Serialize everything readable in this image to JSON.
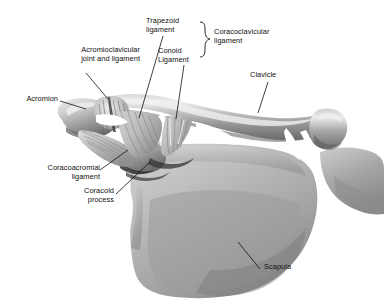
{
  "figure": {
    "background_color": "#ffffff",
    "ink_color": "#101010",
    "width": 384,
    "height": 300,
    "style": "grayscale airbrushed medical illustration"
  },
  "labels": {
    "acromioclavicular": "Acromioclavicular\njoint and ligament",
    "acromion": "Acromion",
    "trapezoid": "Trapezoid\nligament",
    "conoid": "Conoid\nLigament",
    "coracoclavicular": "Coracoclavicular\nligament",
    "clavicle": "Clavicle",
    "coracoacromial": "Coracoacromial\nligament",
    "coracoid": "Coracoid\nprocess",
    "scapula": "Scapula"
  },
  "structures": {
    "bones": [
      "acromion",
      "clavicle",
      "scapula",
      "coracoid process"
    ],
    "ligaments": [
      "acromioclavicular ligament",
      "trapezoid ligament",
      "conoid ligament",
      "coracoacromial ligament"
    ],
    "grouping": {
      "coracoclavicular ligament": [
        "trapezoid ligament",
        "conoid ligament"
      ]
    }
  },
  "palette": {
    "bone_light": "#e8e8e8",
    "bone_mid": "#b4b4b4",
    "bone_dark": "#7c7c7c",
    "bone_shadow": "#4e4e4e",
    "ligament_light": "#dcdcdc",
    "ligament_mid": "#a8a8a8",
    "outline": "#2a2a2a"
  }
}
